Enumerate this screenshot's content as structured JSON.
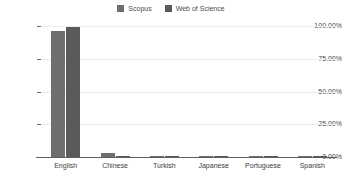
{
  "chart_data": {
    "type": "bar",
    "title": "",
    "subtitle": "",
    "xlabel": "",
    "ylabel": "",
    "categories": [
      "English",
      "Chinese",
      "Turkish",
      "Japanese",
      "Portuguese",
      "Spanish"
    ],
    "series": [
      {
        "name": "Scopus",
        "color": "#6e6e6e",
        "values": [
          96.0,
          2.8,
          0.4,
          0.2,
          0.1,
          0.1
        ]
      },
      {
        "name": "Web of Science",
        "color": "#5a5a5a",
        "values": [
          99.0,
          0.6,
          0.2,
          0.1,
          0.05,
          0.05
        ]
      }
    ],
    "ylim": [
      0,
      100
    ],
    "yticks": [
      0,
      25,
      50,
      75,
      100
    ],
    "ytick_labels": [
      "0.00%",
      "25.00%",
      "50.00%",
      "75.00%",
      "100.00%"
    ],
    "grid": true,
    "grid_color": "#ececed",
    "legend_position": "top-center",
    "axis_color": "#5f5f5f",
    "background": "#ffffff"
  },
  "legend": {
    "entries": [
      {
        "label": "Scopus",
        "swatch_name": "legend-swatch-scopus"
      },
      {
        "label": "Web of Science",
        "swatch_name": "legend-swatch-web-of-science"
      }
    ]
  }
}
